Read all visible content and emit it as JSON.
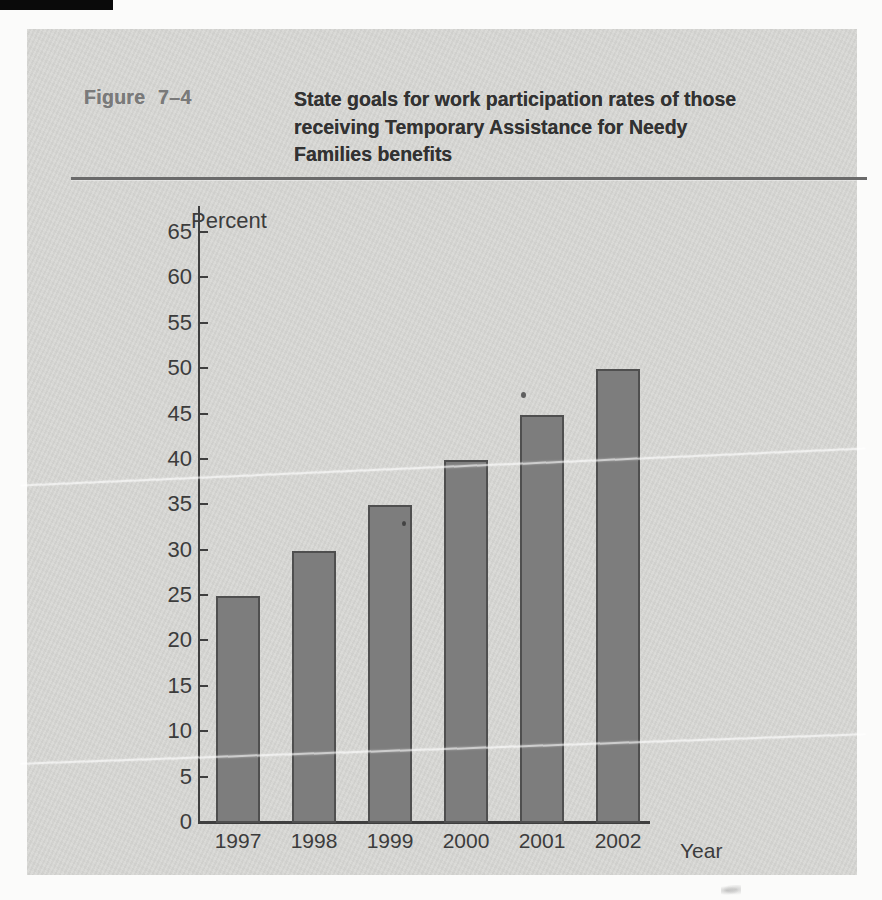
{
  "figure": {
    "label": "Figure 7–4",
    "title_lines": [
      "State goals for work participation rates of those",
      "receiving Temporary Assistance for Needy",
      "Families benefits"
    ]
  },
  "chart_data": {
    "type": "bar",
    "title": "State goals for work participation rates of those receiving Temporary Assistance for Needy Families benefits",
    "categories": [
      "1997",
      "1998",
      "1999",
      "2000",
      "2001",
      "2002"
    ],
    "values": [
      25,
      30,
      35,
      40,
      45,
      50
    ],
    "xlabel": "Year",
    "ylabel": "Percent",
    "ylim": [
      0,
      65
    ],
    "yticks": [
      0,
      5,
      10,
      15,
      20,
      25,
      30,
      35,
      40,
      45,
      50,
      55,
      60,
      65
    ],
    "grid": false,
    "legend": "none",
    "bar_color": "#7d7d7d",
    "bar_border_color": "#4f4f4f"
  },
  "colors": {
    "page_bg": "#fbfbfa",
    "card_bg": "#d8d8d5",
    "figure_label_text": "#7a7a7a",
    "title_text": "#323232",
    "rule": "#6a6a6a",
    "axis_text": "#3c3c3c"
  }
}
